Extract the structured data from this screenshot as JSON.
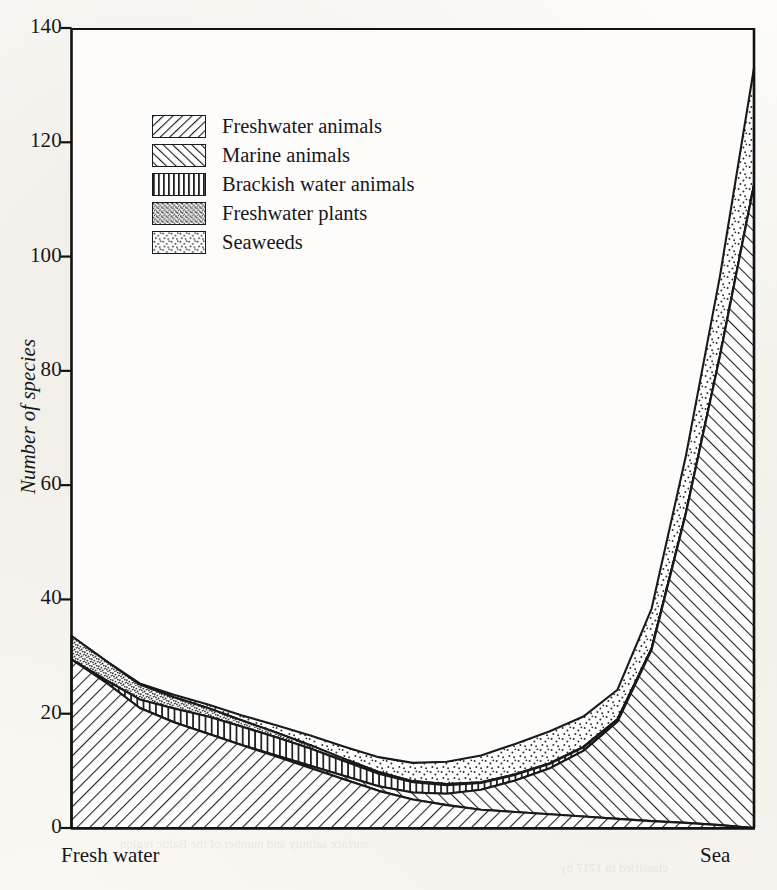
{
  "chart_data": {
    "type": "area",
    "title": "",
    "subtitle": "",
    "xlabel": "",
    "ylabel": "Number of species",
    "x_axis_left_label": "Fresh water",
    "x_axis_right_label": "Sea",
    "stacked": true,
    "grid": false,
    "legend_position": "top-left-inside",
    "ylim": [
      0,
      140
    ],
    "yticks": [
      0,
      20,
      40,
      60,
      80,
      100,
      120,
      140
    ],
    "ytick_labels": [
      "0",
      "20",
      "40",
      "60",
      "80",
      "100",
      "120",
      "140"
    ],
    "xlim": [
      0,
      100
    ],
    "x": [
      0,
      5,
      10,
      15,
      20,
      25,
      30,
      35,
      40,
      45,
      50,
      55,
      60,
      65,
      70,
      75,
      80,
      85,
      90,
      95,
      100
    ],
    "series": [
      {
        "name": "Freshwater animals",
        "pattern": "forward-diagonal-hatch",
        "values": [
          29.5,
          25.5,
          21.0,
          18.5,
          16.5,
          14.5,
          12.5,
          10.5,
          8.5,
          6.5,
          5.0,
          4.0,
          3.2,
          2.8,
          2.4,
          2.0,
          1.6,
          1.2,
          0.9,
          0.5,
          0.0
        ]
      },
      {
        "name": "Marine animals",
        "pattern": "backward-diagonal-hatch",
        "values": [
          0.0,
          0.0,
          0.0,
          0.0,
          0.0,
          0.0,
          0.2,
          0.4,
          0.6,
          0.8,
          1.2,
          2.0,
          3.5,
          5.5,
          8.0,
          11.5,
          17.0,
          30.0,
          54.0,
          82.0,
          112.5
        ]
      },
      {
        "name": "Brackish water animals",
        "pattern": "vertical-lines",
        "values": [
          0.0,
          0.4,
          1.5,
          2.4,
          3.0,
          3.2,
          3.2,
          3.0,
          2.6,
          2.2,
          1.8,
          1.5,
          1.2,
          1.0,
          0.8,
          0.6,
          0.4,
          0.2,
          0.1,
          0.0,
          0.0
        ]
      },
      {
        "name": "Freshwater plants",
        "pattern": "dense-stipple",
        "values": [
          4.1,
          3.4,
          2.6,
          2.0,
          1.5,
          1.1,
          0.8,
          0.6,
          0.4,
          0.3,
          0.2,
          0.2,
          0.1,
          0.1,
          0.1,
          0.1,
          0.0,
          0.0,
          0.0,
          0.0,
          0.0
        ]
      },
      {
        "name": "Seaweeds",
        "pattern": "sparse-stipple",
        "values": [
          0.0,
          0.0,
          0.2,
          0.4,
          0.6,
          0.9,
          1.3,
          1.7,
          2.1,
          2.6,
          3.2,
          3.9,
          4.7,
          5.3,
          5.6,
          5.3,
          5.2,
          7.0,
          10.0,
          14.0,
          20.5
        ]
      }
    ],
    "stack_order": [
      "Freshwater animals",
      "Marine animals",
      "Brackish water animals",
      "Freshwater plants",
      "Seaweeds"
    ],
    "stack_totals": [
      33.6,
      29.3,
      25.3,
      23.3,
      21.6,
      19.7,
      18.0,
      16.2,
      14.2,
      12.4,
      11.4,
      11.6,
      12.7,
      14.7,
      16.9,
      19.5,
      24.2,
      38.4,
      65.0,
      96.5,
      133.0
    ],
    "ink_color": "#1a1a1a",
    "paper_color": "#fbfaf7"
  },
  "legend": {
    "items": [
      {
        "label": "Freshwater animals",
        "pattern": "forward-diagonal-hatch"
      },
      {
        "label": "Marine animals",
        "pattern": "backward-diagonal-hatch"
      },
      {
        "label": "Brackish water animals",
        "pattern": "vertical-lines"
      },
      {
        "label": "Freshwater plants",
        "pattern": "dense-stipple"
      },
      {
        "label": "Seaweeds",
        "pattern": "sparse-stipple"
      }
    ]
  },
  "bleed_through": {
    "line1": "Surface salinity (%) in the Baltic",
    "line2": "with depth in metres",
    "line3": "surface salinity and number of the Baltic region",
    "line4": "classified in 1717 by"
  }
}
